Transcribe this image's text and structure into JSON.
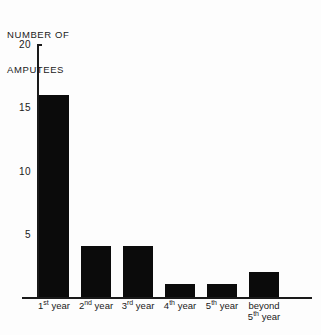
{
  "chart_data": {
    "type": "bar",
    "title": "NUMBER OF AMPUTEES",
    "title_lines": [
      "NUMBER OF",
      "AMPUTEES"
    ],
    "xlabel": "",
    "ylabel": "NUMBER OF AMPUTEES",
    "categories": [
      "1st year",
      "2nd year",
      "3rd year",
      "4th year",
      "5th year",
      "beyond 5th year"
    ],
    "values": [
      16,
      4,
      4,
      1,
      1,
      2
    ],
    "ylim": [
      0,
      20
    ],
    "yticks": [
      5,
      10,
      15,
      20
    ],
    "ytick_labels": [
      "5",
      "10",
      "15",
      "20"
    ],
    "grid": false,
    "legend": false,
    "bar_color": "#0b0b0b",
    "axis_color": "#1a1a1a",
    "background": "#fdfdfd"
  },
  "categories_parts": [
    {
      "stem": "1",
      "ord": "st",
      "tail": " year",
      "line2": ""
    },
    {
      "stem": "2",
      "ord": "nd",
      "tail": " year",
      "line2": ""
    },
    {
      "stem": "3",
      "ord": "rd",
      "tail": " year",
      "line2": ""
    },
    {
      "stem": "4",
      "ord": "th",
      "tail": " year",
      "line2": ""
    },
    {
      "stem": "5",
      "ord": "th",
      "tail": " year",
      "line2": ""
    },
    {
      "stem": "beyond",
      "ord": "",
      "tail": "",
      "line2": "5th year"
    }
  ]
}
